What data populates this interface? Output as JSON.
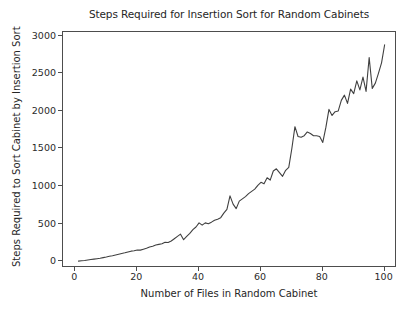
{
  "figure": {
    "background_color": "#ffffff",
    "line_color": "#404040",
    "axes_color": "#4d4d4d"
  },
  "chart_data": {
    "type": "line",
    "title": "Steps Required for Insertion Sort for Random Cabinets",
    "xlabel": "Number of Files in Random Cabinet",
    "ylabel": "Steps Required to Sort Cabinet by Insertion Sort",
    "xlim": [
      -4,
      104
    ],
    "ylim": [
      -90,
      3050
    ],
    "xticks": [
      0,
      20,
      40,
      60,
      80,
      100
    ],
    "yticks": [
      0,
      500,
      1000,
      1500,
      2000,
      2500,
      3000
    ],
    "xtick_labels": [
      "0",
      "20",
      "40",
      "60",
      "80",
      "100"
    ],
    "ytick_labels": [
      "0",
      "500",
      "1000",
      "1500",
      "2000",
      "2500",
      "3000"
    ],
    "grid": false,
    "legend": null,
    "series": [
      {
        "name": "steps",
        "x": [
          1,
          2,
          3,
          4,
          5,
          6,
          7,
          8,
          9,
          10,
          11,
          12,
          13,
          14,
          15,
          16,
          17,
          18,
          19,
          20,
          21,
          22,
          23,
          24,
          25,
          26,
          27,
          28,
          29,
          30,
          31,
          32,
          33,
          34,
          35,
          36,
          37,
          38,
          39,
          40,
          41,
          42,
          43,
          44,
          45,
          46,
          47,
          48,
          49,
          50,
          51,
          52,
          53,
          54,
          55,
          56,
          57,
          58,
          59,
          60,
          61,
          62,
          63,
          64,
          65,
          66,
          67,
          68,
          69,
          70,
          71,
          72,
          73,
          74,
          75,
          76,
          77,
          78,
          79,
          80,
          81,
          82,
          83,
          84,
          85,
          86,
          87,
          88,
          89,
          90,
          91,
          92,
          93,
          94,
          95,
          96,
          97,
          98,
          99,
          100
        ],
        "values": [
          2,
          6,
          10,
          16,
          22,
          28,
          34,
          40,
          48,
          56,
          66,
          74,
          84,
          94,
          104,
          112,
          124,
          134,
          140,
          150,
          148,
          160,
          172,
          190,
          200,
          216,
          224,
          232,
          252,
          250,
          270,
          300,
          330,
          360,
          286,
          330,
          370,
          420,
          455,
          510,
          480,
          510,
          500,
          520,
          545,
          560,
          580,
          640,
          690,
          870,
          760,
          700,
          800,
          830,
          860,
          900,
          930,
          960,
          1010,
          1050,
          1030,
          1110,
          1080,
          1200,
          1230,
          1180,
          1130,
          1210,
          1250,
          1500,
          1790,
          1660,
          1650,
          1670,
          1720,
          1700,
          1670,
          1670,
          1660,
          1580,
          1780,
          2020,
          1940,
          1990,
          2000,
          2140,
          2210,
          2100,
          2290,
          2230,
          2400,
          2280,
          2450,
          2260,
          2710,
          2300,
          2370,
          2500,
          2640,
          2880
        ]
      }
    ]
  }
}
